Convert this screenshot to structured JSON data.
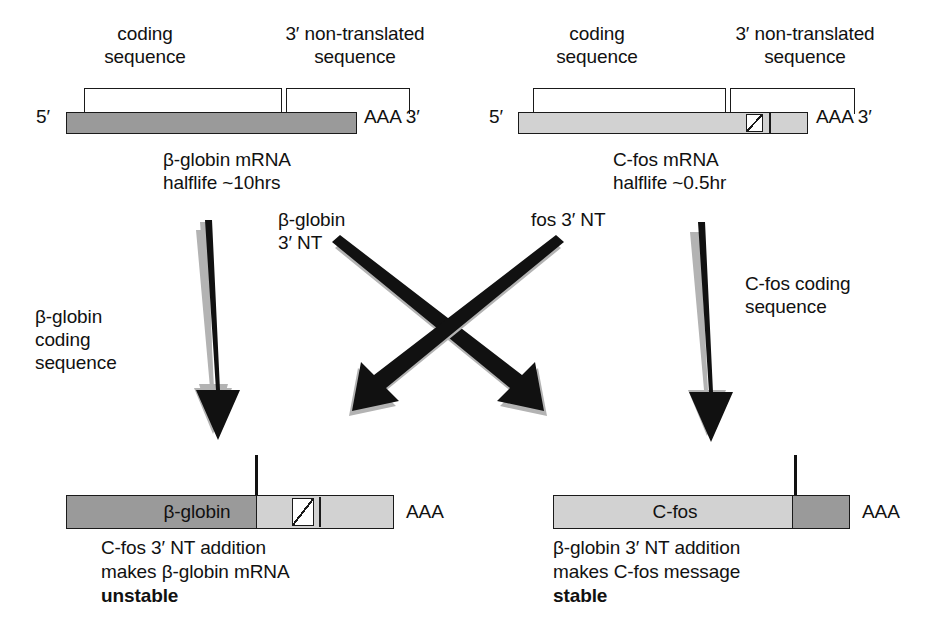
{
  "top_left": {
    "bracket_coding_label": "coding\nsequence",
    "bracket_nt_label": "3′ non-translated\nsequence",
    "five_prime": "5′",
    "three_prime": "AAA 3′",
    "caption": "β-globin mRNA\nhalflife ~10hrs"
  },
  "top_right": {
    "bracket_coding_label": "coding\nsequence",
    "bracket_nt_label": "3′ non-translated\nsequence",
    "five_prime": "5′",
    "three_prime": "AAA 3′",
    "caption": "C-fos mRNA\nhalflife ~0.5hr"
  },
  "middle": {
    "bglobin_nt_label": "β-globin\n3′ NT",
    "fos_nt_label": "fos 3′ NT",
    "bglobin_coding_label": "β-globin\ncoding\nsequence",
    "cfos_coding_label": "C-fos coding\nsequence"
  },
  "bottom_left": {
    "bar_label": "β-globin",
    "poly_a": "AAA",
    "caption_line1": "C-fos 3′ NT addition",
    "caption_line2": "makes β-globin mRNA",
    "caption_line3": "unstable"
  },
  "bottom_right": {
    "bar_label": "C-fos",
    "poly_a": "AAA",
    "caption_line1": "β-globin 3′ NT addition",
    "caption_line2": "makes C-fos message",
    "caption_line3": "stable"
  },
  "colors": {
    "coding_dark_gray": "#9a9a9a",
    "nt_light_gray": "#d2d2d2",
    "outline": "#1a1a1a",
    "arrow_black": "#111111",
    "arrow_shadow_gray": "#b3b3b3",
    "background": "#ffffff"
  },
  "icons": {
    "down_arrow": "down-arrow",
    "diagonal_arrow": "diagonal-arrow"
  }
}
